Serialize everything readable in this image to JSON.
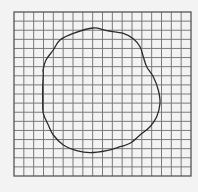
{
  "figure": {
    "background_color": "#f3f3f3",
    "grid": {
      "x0": 14,
      "y0": 12,
      "x1": 191,
      "y1": 176,
      "columns": 18,
      "rows": 18,
      "line_color": "#7a7a7a",
      "line_width": 1,
      "border_color": "#555555",
      "border_width": 1.3
    },
    "curve": {
      "closed": true,
      "stroke_color": "#2b2b2b",
      "stroke_width": 1.3,
      "points": [
        [
          43,
          70
        ],
        [
          46,
          60
        ],
        [
          53.3,
          50
        ],
        [
          60,
          40
        ],
        [
          73.3,
          33.3
        ],
        [
          93.3,
          28
        ],
        [
          106.7,
          30.7
        ],
        [
          123.3,
          33.3
        ],
        [
          133.3,
          38.7
        ],
        [
          140,
          46.7
        ],
        [
          143.3,
          56.7
        ],
        [
          146.7,
          66.7
        ],
        [
          153.3,
          76.7
        ],
        [
          158.3,
          90
        ],
        [
          160,
          103.3
        ],
        [
          156.7,
          116.7
        ],
        [
          150,
          126.7
        ],
        [
          140,
          135
        ],
        [
          130,
          143.3
        ],
        [
          120,
          146.7
        ],
        [
          106.7,
          150.7
        ],
        [
          90,
          152.7
        ],
        [
          76.7,
          150.7
        ],
        [
          63.3,
          145
        ],
        [
          53.3,
          135
        ],
        [
          48.3,
          125
        ],
        [
          43.3,
          113.3
        ],
        [
          42.7,
          100
        ],
        [
          42.7,
          86.7
        ],
        [
          43.3,
          73.3
        ]
      ]
    }
  }
}
